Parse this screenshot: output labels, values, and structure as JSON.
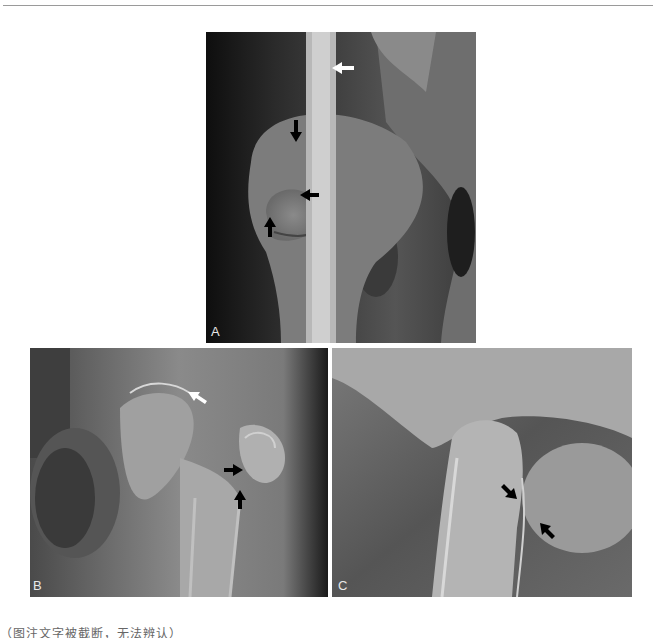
{
  "figure": {
    "panels": [
      {
        "label": "A",
        "description": "Radiograph, lateral view of hip/femur with white arrow on elongated radiopaque structure and three black arrows at femoral head region"
      },
      {
        "label": "B",
        "description": "Radiograph of hip joint, white arrow at acetabular rim, two black arrows at femoral head"
      },
      {
        "label": "C",
        "description": "Radiograph of hip joint, two black arrows at femoral neck"
      }
    ],
    "caption": "（图注文字被截断，无法辨认）"
  },
  "colors": {
    "background": "#ffffff",
    "rule": "#9a9a9a",
    "label": "#e8e8e8"
  }
}
